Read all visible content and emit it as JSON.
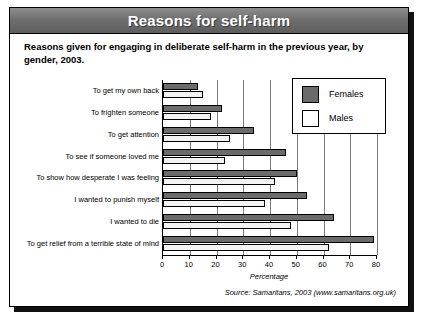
{
  "banner": {
    "title": "Reasons for self-harm"
  },
  "subtitle": "Reasons given for engaging in deliberate self-harm in the previous year, by gender, 2003.",
  "source": "Source: Samaritans, 2003 (www.samaritans.org.uk)",
  "legend": {
    "items": [
      {
        "label": "Females",
        "color": "#6b6b6b"
      },
      {
        "label": "Males",
        "color": "#ffffff"
      }
    ]
  },
  "chart_data": {
    "type": "bar",
    "orientation": "horizontal",
    "title": "Reasons for self-harm",
    "subtitle": "Reasons given for engaging in deliberate self-harm in the previous year, by gender, 2003.",
    "xlabel": "Percentage",
    "ylabel": "",
    "xlim": [
      0,
      80
    ],
    "xticks": [
      0,
      10,
      20,
      30,
      40,
      50,
      60,
      70,
      80
    ],
    "xtick_labels": [
      "0",
      "10",
      "20",
      "30",
      "40",
      "50",
      "60",
      "70",
      "80"
    ],
    "grid": true,
    "legend_position": "top-right",
    "categories": [
      "To get my own back",
      "To frighten someone",
      "To get attention",
      "To see if someone loved me",
      "To show how desperate I was feeling",
      "I wanted to punish myself",
      "I wanted to die",
      "To get relief from a terrible state of mind"
    ],
    "series": [
      {
        "name": "Females",
        "color": "#6b6b6b",
        "values": [
          13,
          22,
          34,
          46,
          50,
          54,
          64,
          79
        ]
      },
      {
        "name": "Males",
        "color": "#ffffff",
        "values": [
          15,
          18,
          25,
          23,
          42,
          38,
          48,
          62
        ]
      }
    ],
    "annotations": [
      "Source: Samaritans, 2003 (www.samaritans.org.uk)"
    ]
  }
}
